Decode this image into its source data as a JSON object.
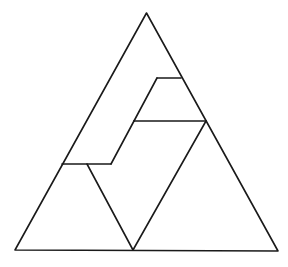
{
  "diagram": {
    "stroke_color": "#1a1a1a",
    "background": "#ffffff",
    "outer_triangle": [
      [
        146.5,
        13
      ],
      [
        15,
        250
      ],
      [
        278,
        251
      ]
    ],
    "segments": [
      {
        "name": "top-step-horizontal",
        "points": [
          [
            157,
            78
          ],
          [
            181,
            78
          ]
        ]
      },
      {
        "name": "upper-slant",
        "points": [
          [
            157,
            78
          ],
          [
            134,
            121
          ]
        ]
      },
      {
        "name": "middle-horizontal",
        "points": [
          [
            134,
            121
          ],
          [
            206,
            121
          ]
        ]
      },
      {
        "name": "middle-slant",
        "points": [
          [
            134,
            121
          ],
          [
            111,
            164
          ]
        ]
      },
      {
        "name": "lower-step-horizontal",
        "points": [
          [
            62,
            164
          ],
          [
            111,
            164
          ]
        ]
      },
      {
        "name": "inner-left-diagonal",
        "points": [
          [
            87,
            164
          ],
          [
            133,
            250
          ]
        ]
      },
      {
        "name": "inner-right-diagonal",
        "points": [
          [
            206,
            121
          ],
          [
            133,
            250
          ]
        ]
      }
    ]
  }
}
